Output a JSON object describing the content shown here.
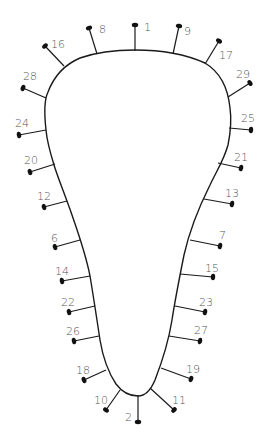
{
  "diagram": {
    "colors": {
      "line": "#1a1a1a",
      "label": "#555555",
      "background": "#ffffff"
    },
    "outline_path": "M 46 130 C 44 112, 44 100, 48 92 C 54 76, 66 64, 80 58 C 100 51, 120 50, 135 50 C 160 50, 185 54, 205 63 C 220 72, 228 88, 230 108 C 232 122, 230 135, 228 145 C 224 160, 216 172, 210 185 C 200 205, 190 228, 184 255 C 179 280, 175 300, 172 320 C 168 345, 162 362, 155 380 C 150 392, 144 396, 138 396 C 130 396, 122 392, 116 384 C 108 372, 103 358, 100 340 C 97 320, 94 300, 90 276 C 86 255, 80 238, 72 215 C 65 195, 58 178, 54 165 C 50 152, 47 142, 46 130 Z",
    "pins": [
      {
        "label": "1",
        "base": [
          135,
          51
        ],
        "tip": [
          135,
          25
        ],
        "text": [
          144,
          31
        ]
      },
      {
        "label": "8",
        "base": [
          97,
          54
        ],
        "tip": [
          89,
          28
        ],
        "text": [
          99,
          33
        ]
      },
      {
        "label": "9",
        "base": [
          173,
          54
        ],
        "tip": [
          179,
          26
        ],
        "text": [
          184,
          35
        ]
      },
      {
        "label": "16",
        "base": [
          64,
          66
        ],
        "tip": [
          45,
          46
        ],
        "text": [
          51,
          48
        ]
      },
      {
        "label": "17",
        "base": [
          205,
          64
        ],
        "tip": [
          219,
          41
        ],
        "text": [
          219,
          59
        ]
      },
      {
        "label": "28",
        "base": [
          46,
          98
        ],
        "tip": [
          23,
          88
        ],
        "text": [
          23,
          80
        ]
      },
      {
        "label": "29",
        "base": [
          228,
          97
        ],
        "tip": [
          250,
          83
        ],
        "text": [
          236,
          78
        ]
      },
      {
        "label": "24",
        "base": [
          46,
          130
        ],
        "tip": [
          19,
          135
        ],
        "text": [
          15,
          127
        ]
      },
      {
        "label": "25",
        "base": [
          229,
          128
        ],
        "tip": [
          251,
          130
        ],
        "text": [
          241,
          122
        ]
      },
      {
        "label": "20",
        "base": [
          55,
          164
        ],
        "tip": [
          30,
          172
        ],
        "text": [
          24,
          164
        ]
      },
      {
        "label": "21",
        "base": [
          218,
          163
        ],
        "tip": [
          241,
          168
        ],
        "text": [
          234,
          161
        ]
      },
      {
        "label": "12",
        "base": [
          67,
          201
        ],
        "tip": [
          44,
          207
        ],
        "text": [
          37,
          200
        ]
      },
      {
        "label": "13",
        "base": [
          204,
          199
        ],
        "tip": [
          232,
          204
        ],
        "text": [
          225,
          197
        ]
      },
      {
        "label": "6",
        "base": [
          80,
          240
        ],
        "tip": [
          55,
          247
        ],
        "text": [
          51,
          242
        ]
      },
      {
        "label": "7",
        "base": [
          190,
          240
        ],
        "tip": [
          220,
          246
        ],
        "text": [
          219,
          239
        ]
      },
      {
        "label": "14",
        "base": [
          90,
          276
        ],
        "tip": [
          62,
          281
        ],
        "text": [
          55,
          275
        ]
      },
      {
        "label": "15",
        "base": [
          180,
          274
        ],
        "tip": [
          213,
          277
        ],
        "text": [
          205,
          272
        ]
      },
      {
        "label": "22",
        "base": [
          95,
          306
        ],
        "tip": [
          69,
          312
        ],
        "text": [
          61,
          306
        ]
      },
      {
        "label": "23",
        "base": [
          175,
          306
        ],
        "tip": [
          205,
          312
        ],
        "text": [
          199,
          306
        ]
      },
      {
        "label": "26",
        "base": [
          99,
          336
        ],
        "tip": [
          74,
          341
        ],
        "text": [
          66,
          335
        ]
      },
      {
        "label": "27",
        "base": [
          169,
          336
        ],
        "tip": [
          200,
          341
        ],
        "text": [
          194,
          334
        ]
      },
      {
        "label": "18",
        "base": [
          106,
          370
        ],
        "tip": [
          84,
          380
        ],
        "text": [
          76,
          374
        ]
      },
      {
        "label": "19",
        "base": [
          161,
          368
        ],
        "tip": [
          191,
          379
        ],
        "text": [
          186,
          373
        ]
      },
      {
        "label": "10",
        "base": [
          120,
          390
        ],
        "tip": [
          106,
          410
        ],
        "text": [
          94,
          404
        ]
      },
      {
        "label": "11",
        "base": [
          150,
          388
        ],
        "tip": [
          174,
          410
        ],
        "text": [
          172,
          404
        ]
      },
      {
        "label": "2",
        "base": [
          138,
          395
        ],
        "tip": [
          138,
          422
        ],
        "text": [
          125,
          421
        ]
      }
    ]
  }
}
